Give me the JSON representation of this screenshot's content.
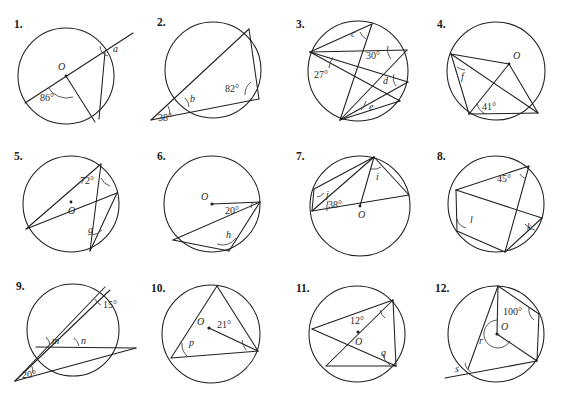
{
  "worksheet": {
    "title": "Circle Theorems Exercise",
    "panel_count": 12,
    "background_color": "#ffffff",
    "ink_color": "#1f1f1f"
  },
  "panels": [
    {
      "number": "1.",
      "center_label": "O",
      "given_angles": [
        "86°"
      ],
      "unknown_labels": [
        "a"
      ],
      "description": "Circle with centre O; a secant line passes through O extending beyond the circle to the upper right; a chord from the lower point meets the upper right point; angle 86 degrees at centre, angle a at circumference."
    },
    {
      "number": "2.",
      "center_label": "",
      "given_angles": [
        "38°",
        "82°"
      ],
      "unknown_labels": [
        "b"
      ],
      "description": "Two secants meeting at an external point to the lower left; angle 38 degrees at the external point, 82 degrees inside the circle at the right vertex, b at the near intersection."
    },
    {
      "number": "3.",
      "center_label": "",
      "given_angles": [
        "27°",
        "30°"
      ],
      "unknown_labels": [
        "c",
        "d",
        "e"
      ],
      "description": "Several chords forming inscribed angles; 27 degrees at the left vertex, 30 degrees near the upper right, with unknown angles c, d and e."
    },
    {
      "number": "4.",
      "center_label": "O",
      "given_angles": [
        "41°"
      ],
      "unknown_labels": [
        "f"
      ],
      "description": "Circle with centre O; radii to two points plus chords; 41 degrees at the lower left vertex, f at the upper left vertex."
    },
    {
      "number": "5.",
      "center_label": "O",
      "given_angles": [
        "72°"
      ],
      "unknown_labels": [
        "g"
      ],
      "description": "Circle with centre O marked by a dot; crossing chords; 72 degrees near the top right, g lower right."
    },
    {
      "number": "6.",
      "center_label": "O",
      "given_angles": [
        "20°"
      ],
      "unknown_labels": [
        "h"
      ],
      "description": "Circle with centre O; horizontal radius to the right edge with 20 degrees between it and a chord; h is the angle at the lower vertex."
    },
    {
      "number": "7.",
      "center_label": "O",
      "given_angles": [
        "38°"
      ],
      "unknown_labels": [
        "i",
        "j"
      ],
      "description": "Circle with centre O; a diameter through O; 38 degrees at the left vertex; unknown angles i (top right) and j (upper left)."
    },
    {
      "number": "8.",
      "center_label": "",
      "given_angles": [
        "45°"
      ],
      "unknown_labels": [
        "k",
        "l"
      ],
      "description": "Cyclic quadrilateral with crossing chords; 45 degrees at the top right, k at the right vertex and l at the left vertex."
    },
    {
      "number": "9.",
      "center_label": "",
      "given_angles": [
        "15°",
        "20°"
      ],
      "unknown_labels": [
        "m",
        "n"
      ],
      "description": "Two secants meeting outside the circle at the lower left; 20 degrees at the external point, 15 degrees at the top right; m and n are angles on the chord."
    },
    {
      "number": "10.",
      "center_label": "O",
      "given_angles": [
        "21°"
      ],
      "unknown_labels": [
        "p"
      ],
      "description": "Inscribed triangle with centre O marked; 21 degrees between the radius direction and a chord to the right vertex; p at the left vertex."
    },
    {
      "number": "11.",
      "center_label": "O",
      "given_angles": [
        "12°"
      ],
      "unknown_labels": [
        "q"
      ],
      "description": "Circle with centre O; a diameter and chords; 12 degrees at the top right vertex; q at the lower right vertex."
    },
    {
      "number": "12.",
      "center_label": "O",
      "given_angles": [
        "100°"
      ],
      "unknown_labels": [
        "r",
        "s"
      ],
      "description": "Cyclic quadrilateral with centre O and a tangent-like line extending to the lower left; 100 degrees at the upper right vertex; r is the reflex angle at O and s is the exterior angle at the lower left."
    }
  ]
}
